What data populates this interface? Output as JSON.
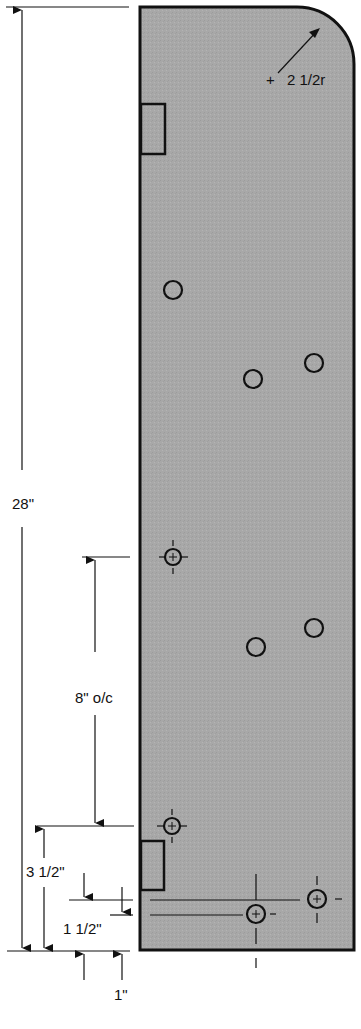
{
  "diagram": {
    "type": "technical-drawing",
    "panel_fill": "#a9a9a9",
    "line_color": "#111111",
    "dimensions": {
      "overall_height": "28\"",
      "corner_radius": "2 1/2r",
      "hole_spacing": "8\" o/c",
      "bottom_hole_offset": "3 1/2\"",
      "lower_line_offset": "1 1/2\"",
      "bottom_gap": "1\""
    }
  }
}
